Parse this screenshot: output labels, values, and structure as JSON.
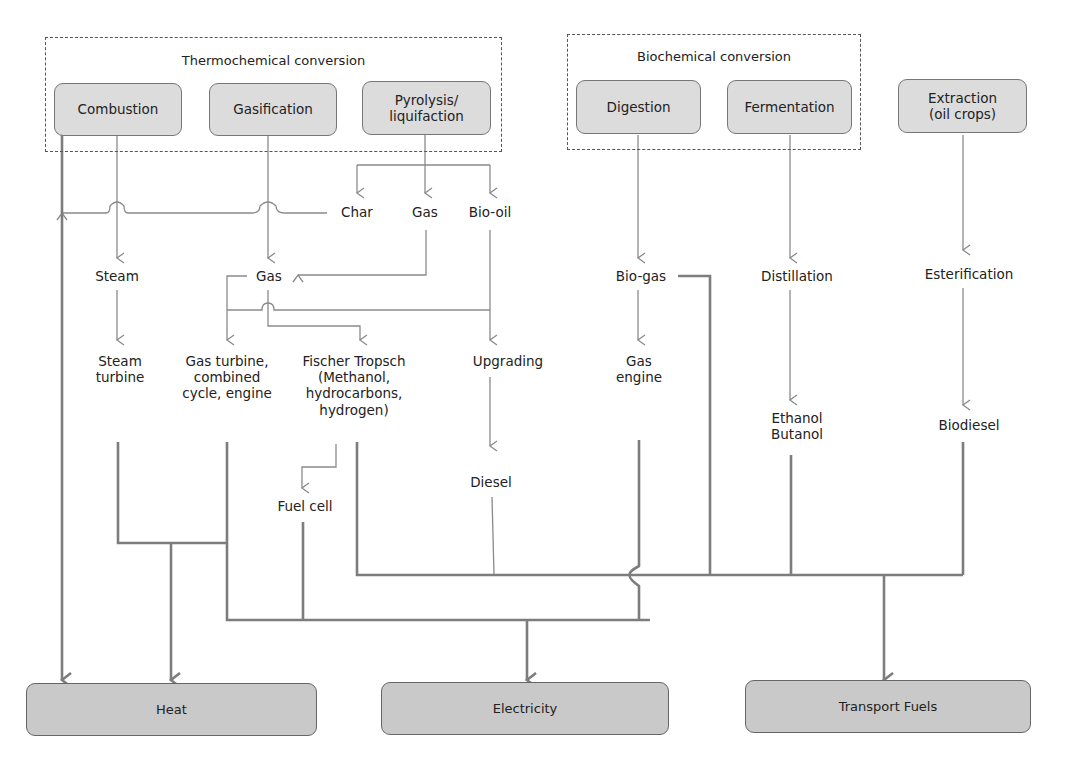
{
  "groups": {
    "thermochemical": {
      "title": "Thermochemical conversion"
    },
    "biochemical": {
      "title": "Biochemical conversion"
    }
  },
  "processes": {
    "combustion": "Combustion",
    "gasification": "Gasification",
    "pyrolysis": "Pyrolysis/\nliquifaction",
    "digestion": "Digestion",
    "fermentation": "Fermentation",
    "extraction": "Extraction\n(oil crops)"
  },
  "intermediates": {
    "char": "Char",
    "pyro_gas": "Gas",
    "bio_oil": "Bio-oil",
    "steam": "Steam",
    "gas": "Gas",
    "steam_turbine": "Steam\nturbine",
    "gas_turbine": "Gas turbine,\ncombined\ncycle, engine",
    "fischer_tropsch": "Fischer Tropsch\n(Methanol,\nhydrocarbons,\nhydrogen)",
    "upgrading": "Upgrading",
    "fuel_cell": "Fuel cell",
    "diesel": "Diesel",
    "bio_gas": "Bio-gas",
    "gas_engine": "Gas\nengine",
    "distillation": "Distillation",
    "ethanol_butanol": "Ethanol\nButanol",
    "esterification": "Esterification",
    "biodiesel": "Biodiesel"
  },
  "outputs": {
    "heat": "Heat",
    "electricity": "Electricity",
    "transport_fuels": "Transport Fuels"
  },
  "colors": {
    "thin_line": "#8a8a8a",
    "thick_line": "#7d7d7d",
    "process_fill": "#dcdcdc",
    "output_fill": "#c9c9c9"
  }
}
